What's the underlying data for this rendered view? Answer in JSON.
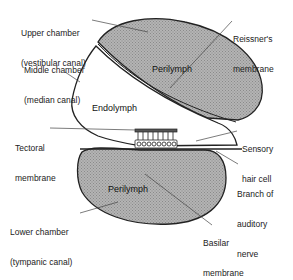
{
  "diagram": {
    "regions": {
      "upper_perilymph": "Perilymph",
      "endolymph": "Endolymph",
      "lower_perilymph": "Perilymph"
    },
    "labels": [
      {
        "id": "upper-chamber",
        "line1": "Upper chamber",
        "line2": "(vestibular canal)"
      },
      {
        "id": "middle-chamber",
        "line1": "Middle chamber",
        "line2": "(median canal)"
      },
      {
        "id": "tectoral-membrane",
        "line1": "Tectoral",
        "line2": "membrane"
      },
      {
        "id": "lower-chamber",
        "line1": "Lower chamber",
        "line2": "(tympanic canal)"
      },
      {
        "id": "reissners-membrane",
        "line1": "Reissner's",
        "line2": "membrane"
      },
      {
        "id": "sensory-hair-cell",
        "line1": "Sensory",
        "line2": "hair cell"
      },
      {
        "id": "auditory-nerve",
        "line1": "Branch of",
        "line2": "auditory",
        "line3": "nerve"
      },
      {
        "id": "basilar-membrane",
        "line1": "Basilar",
        "line2": "membrane"
      }
    ],
    "colors": {
      "perilymph_fill": "#a8a8a8",
      "outline": "#222222",
      "background": "#ffffff"
    }
  }
}
